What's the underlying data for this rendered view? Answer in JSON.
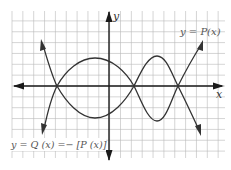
{
  "chart_data": {
    "type": "line",
    "title": "",
    "xlabel": "x",
    "ylabel": "y",
    "grid": true,
    "x_zeros_approx": [
      -5,
      2.3,
      6.5
    ],
    "series": [
      {
        "name": "y = P(x)",
        "description": "Polynomial passing through zeros; positive lobe between first two zeros, negative lobe between second and third; rises to +infinity on the right, rises on the far left",
        "points_px": [
          [
            41,
            40
          ],
          [
            57,
            86
          ],
          [
            95,
            58
          ],
          [
            134,
            86
          ],
          [
            157,
            121
          ],
          [
            178,
            86
          ],
          [
            203,
            41
          ]
        ]
      },
      {
        "name": "y = Q(x) = -[P(x)]",
        "description": "Reflection of P(x) across the x-axis",
        "points_px": [
          [
            42,
            134
          ],
          [
            57,
            86
          ],
          [
            95,
            118
          ],
          [
            134,
            86
          ],
          [
            157,
            56
          ],
          [
            178,
            86
          ],
          [
            201,
            135
          ]
        ]
      }
    ]
  },
  "labels": {
    "x_axis": "x",
    "y_axis": "y",
    "p_curve": "y = P(x)",
    "q_curve": "y = Q (x) =− [P (x)]"
  }
}
